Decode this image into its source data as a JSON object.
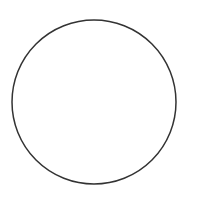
{
  "canvas": {
    "width": 198,
    "height": 208,
    "background": "#ffffff"
  },
  "shapes": [
    {
      "type": "circle",
      "cx": 94,
      "cy": 102,
      "r": 82,
      "stroke": "#333333",
      "stroke_width": 1.5,
      "fill": "none"
    }
  ]
}
